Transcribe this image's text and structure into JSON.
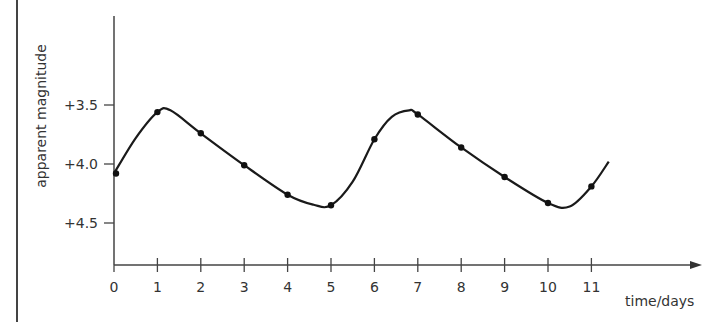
{
  "chart_data": {
    "type": "line",
    "title": "",
    "xlabel": "time/days",
    "ylabel": "apparent magnitude",
    "x": [
      0,
      1,
      2,
      3,
      4,
      5,
      6,
      7,
      8,
      9,
      10,
      11
    ],
    "series": [
      {
        "name": "apparent magnitude",
        "values": [
          4.08,
          3.56,
          3.74,
          4.01,
          4.26,
          4.35,
          3.79,
          3.58,
          3.86,
          4.11,
          4.33,
          4.19
        ]
      }
    ],
    "x_ticks": [
      "0",
      "1",
      "2",
      "3",
      "4",
      "5",
      "6",
      "7",
      "8",
      "9",
      "10",
      "11"
    ],
    "y_ticks": [
      "+3.5",
      "+4.0",
      "+4.5"
    ],
    "y_tick_values": [
      3.5,
      4.0,
      4.5
    ],
    "xlim": [
      0,
      13.5
    ],
    "ylim": [
      4.85,
      2.75
    ],
    "y_inverted": true,
    "grid": false,
    "legend": "none",
    "curve": "smooth periodic curve through data points, period approx 5.7 days",
    "colors": {
      "line": "#1a1a1a",
      "axis": "#333333",
      "text": "#333333"
    }
  },
  "axes": {
    "x_label": "time/days",
    "y_label": "apparent magnitude"
  }
}
